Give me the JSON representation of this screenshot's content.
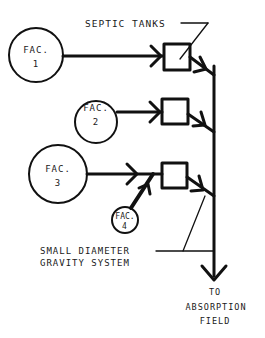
{
  "diagram": {
    "title_label": "SEPTIC TANKS",
    "facilities": [
      {
        "name": "FAC.",
        "number": "1"
      },
      {
        "name": "FAC.",
        "number": "2"
      },
      {
        "name": "FAC.",
        "number": "3"
      },
      {
        "name": "FAC.",
        "number": "4"
      }
    ],
    "system_label_line1": "SMALL DIAMETER",
    "system_label_line2": "GRAVITY SYSTEM",
    "outlet_label_line1": "TO",
    "outlet_label_line2": "ABSORPTION",
    "outlet_label_line3": "FIELD",
    "stroke_color": "#111111"
  }
}
